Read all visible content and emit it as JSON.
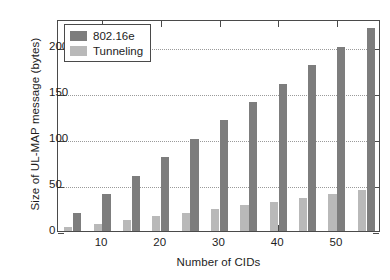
{
  "chart_data": {
    "type": "bar",
    "title": "",
    "xlabel": "Number of CIDs",
    "ylabel": "Size of UL-MAP message (bytes)",
    "categories": [
      5,
      10,
      15,
      20,
      25,
      30,
      35,
      40,
      45,
      50,
      55
    ],
    "xtick_labels": [
      "10",
      "20",
      "30",
      "40",
      "50"
    ],
    "xticks": [
      10,
      20,
      30,
      40,
      50
    ],
    "ytick_labels": [
      "0",
      "50",
      "100",
      "150",
      "200"
    ],
    "yticks": [
      0,
      50,
      100,
      150,
      200
    ],
    "xlim": [
      2.5,
      57.5
    ],
    "ylim": [
      0,
      230
    ],
    "grid": true,
    "grid_axis": "y",
    "legend_position": "upper left",
    "series": [
      {
        "name": "802.16e",
        "color": "#7d7d7d",
        "values": [
          20,
          40,
          60,
          80,
          100,
          120,
          140,
          160,
          180,
          200,
          220
        ]
      },
      {
        "name": "Tunneling",
        "color": "#b9b9b9",
        "values": [
          4,
          8,
          12,
          16,
          20,
          24,
          28,
          32,
          36,
          40,
          44
        ]
      }
    ]
  },
  "legend": {
    "items": [
      {
        "label": "802.16e",
        "swatch": "s1"
      },
      {
        "label": "Tunneling",
        "swatch": "s0"
      }
    ]
  },
  "colors": {
    "series_dark": "#7d7d7d",
    "series_light": "#b9b9b9",
    "axis": "#4a4a4a",
    "grid": "#9a9a9a",
    "text": "#1d1d1d",
    "background": "#ffffff"
  }
}
